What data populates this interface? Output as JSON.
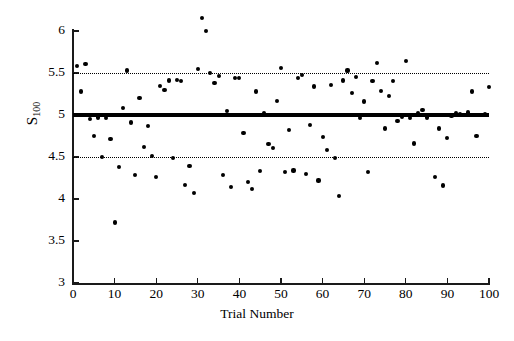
{
  "chart_data": {
    "type": "scatter",
    "title": "",
    "xlabel": "Trial Number",
    "ylabel": "S_100",
    "ylabel_base": "S",
    "ylabel_sub": "100",
    "xlim": [
      0,
      100
    ],
    "ylim": [
      3,
      6
    ],
    "xticks": [
      0,
      10,
      20,
      30,
      40,
      50,
      60,
      70,
      80,
      90,
      100
    ],
    "yticks": [
      3,
      3.5,
      4,
      4.5,
      5,
      5.5,
      6
    ],
    "ytick_labels": [
      "3",
      "3.5",
      "4",
      "4.5",
      "5",
      "5.5",
      "6"
    ],
    "xtick_labels": [
      "0",
      "10",
      "20",
      "30",
      "40",
      "50",
      "60",
      "70",
      "80",
      "90",
      "100"
    ],
    "grid": false,
    "legend": null,
    "marker": "filled-circle",
    "marker_color": "#000000",
    "reference_lines": [
      {
        "name": "center-line",
        "value": 5.0,
        "style": "solid",
        "width": 3.2,
        "color": "#000000"
      },
      {
        "name": "upper-control-limit",
        "value": 5.5,
        "style": "dotted",
        "width": 1.7,
        "color": "#000000"
      },
      {
        "name": "lower-control-limit",
        "value": 4.5,
        "style": "dotted",
        "width": 1.7,
        "color": "#000000"
      }
    ],
    "x": [
      1,
      2,
      3,
      4,
      5,
      6,
      7,
      8,
      9,
      10,
      11,
      12,
      13,
      14,
      15,
      16,
      17,
      18,
      19,
      20,
      21,
      22,
      23,
      24,
      25,
      26,
      27,
      28,
      29,
      30,
      31,
      32,
      33,
      34,
      35,
      36,
      37,
      38,
      39,
      40,
      41,
      42,
      43,
      44,
      45,
      46,
      47,
      48,
      49,
      50,
      51,
      52,
      53,
      54,
      55,
      56,
      57,
      58,
      59,
      60,
      61,
      62,
      63,
      64,
      65,
      66,
      67,
      68,
      69,
      70,
      71,
      72,
      73,
      74,
      75,
      76,
      77,
      78,
      79,
      80,
      81,
      82,
      83,
      84,
      85,
      86,
      87,
      88,
      89,
      90,
      91,
      92,
      93,
      94,
      95,
      96,
      97,
      98,
      99,
      100
    ],
    "y": [
      5.58,
      5.28,
      5.61,
      4.95,
      4.75,
      4.97,
      4.5,
      4.96,
      4.71,
      3.72,
      4.38,
      5.08,
      5.53,
      4.91,
      4.29,
      5.2,
      4.62,
      4.87,
      4.51,
      4.26,
      5.35,
      5.3,
      5.41,
      4.49,
      5.42,
      5.4,
      4.17,
      4.39,
      4.07,
      5.55,
      6.15,
      6.0,
      5.5,
      5.38,
      5.46,
      4.29,
      5.05,
      4.14,
      5.44,
      5.44,
      4.79,
      4.2,
      4.12,
      5.28,
      4.33,
      5.02,
      4.65,
      4.61,
      5.17,
      5.56,
      4.32,
      4.82,
      4.34,
      5.44,
      5.48,
      4.3,
      4.88,
      5.34,
      4.22,
      4.74,
      4.58,
      5.36,
      4.49,
      4.04,
      5.41,
      5.53,
      5.26,
      5.45,
      4.96,
      5.16,
      4.32,
      5.4,
      5.62,
      5.29,
      4.84,
      5.23,
      5.4,
      4.93,
      4.98,
      5.64,
      4.96,
      4.66,
      5.02,
      5.06,
      4.97,
      5.0,
      4.26,
      4.84,
      4.16,
      4.73,
      4.99,
      5.02,
      5.01,
      5.0,
      5.03,
      5.28,
      4.75,
      5.0,
      5.01,
      5.33
    ]
  }
}
